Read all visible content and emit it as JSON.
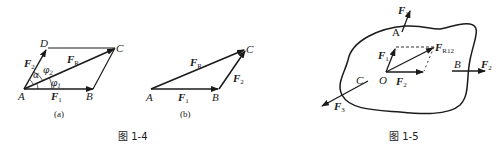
{
  "figure_1_4": {
    "caption": "图 1-4",
    "subfigure_a": {
      "label": "(a)",
      "points": {
        "A": "A",
        "B": "B",
        "C": "C",
        "D": "D"
      },
      "vectors": {
        "F1": "F",
        "F1_sub": "1",
        "F2": "F",
        "F2_sub": "2",
        "FR": "F",
        "FR_sub": "R"
      },
      "angles": {
        "alpha": "α",
        "phi1": "φ",
        "phi1_sub": "1",
        "phi2": "φ",
        "phi2_sub": "2"
      }
    },
    "subfigure_b": {
      "label": "(b)",
      "points": {
        "A": "A",
        "B": "B",
        "C": "C"
      },
      "vectors": {
        "F1": "F",
        "F1_sub": "1",
        "F2": "F",
        "F2_sub": "2",
        "FR": "F",
        "FR_sub": "R"
      }
    }
  },
  "figure_1_5": {
    "caption": "图 1-5",
    "points": {
      "A": "A",
      "B": "B",
      "C": "C",
      "O": "O"
    },
    "vectors": {
      "F1_top": "F",
      "F1_top_sub": "1",
      "F1_inner": "F",
      "F1_inner_sub": "1",
      "F2_inner": "F",
      "F2_inner_sub": "2",
      "F2_right": "F",
      "F2_right_sub": "2",
      "F3": "F",
      "F3_sub": "3",
      "FR12": "F",
      "FR12_sub": "R12"
    }
  },
  "colors": {
    "ink": "#1a1a1a",
    "background": "#ffffff"
  }
}
